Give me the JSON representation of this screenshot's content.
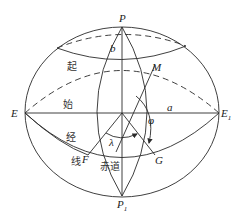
{
  "points": {
    "P": {
      "name": "P",
      "sub": ""
    },
    "P1": {
      "name": "P",
      "sub": "1"
    },
    "E": {
      "name": "E",
      "sub": ""
    },
    "E1": {
      "name": "E",
      "sub": "1"
    },
    "M": {
      "name": "M"
    },
    "F": {
      "name": "F"
    },
    "G": {
      "name": "G"
    }
  },
  "symbols": {
    "semi_minor": "b",
    "semi_major": "a",
    "longitude": "λ",
    "latitude": "φ"
  },
  "annotations": {
    "prime_meridian_chars": [
      "起",
      "始",
      "经",
      "线"
    ],
    "equator": "赤道"
  },
  "colors": {
    "line": "#2a2a2a",
    "background": "#ffffff"
  }
}
